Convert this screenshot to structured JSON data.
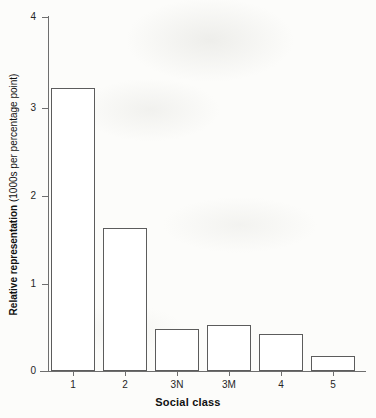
{
  "chart_data": {
    "type": "bar",
    "title": "",
    "subtitle": "",
    "xlabel": "Social class",
    "ylabel": "Relative representation (1000s per percentage point)",
    "ylabel_bold_part": "Relative representation",
    "ylabel_regular_part": " (1000s per percentage point)",
    "categories": [
      "1",
      "2",
      "3N",
      "3M",
      "4",
      "5"
    ],
    "values": [
      3.2,
      1.62,
      0.48,
      0.52,
      0.42,
      0.17
    ],
    "series": [
      {
        "name": "Relative representation",
        "values": [
          3.2,
          1.62,
          0.48,
          0.52,
          0.42,
          0.17
        ]
      }
    ],
    "ylim": [
      0,
      4
    ],
    "yticks": [
      "0",
      "1",
      "2",
      "3",
      "4"
    ],
    "ytick_values": [
      0,
      1,
      2,
      3,
      4
    ],
    "xlim_categories": 6,
    "grid": false,
    "legend": false,
    "legend_position": "none",
    "bar_fill_color": "#ffffff",
    "bar_edge_color": "#5c5c5c",
    "axis_color": "#6e6e6e",
    "text_color": "#111111",
    "background_color": "#fcfcfa"
  }
}
